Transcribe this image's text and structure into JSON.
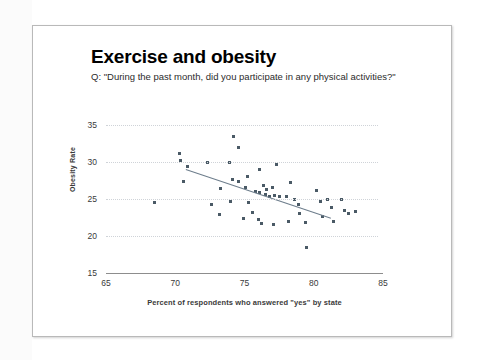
{
  "slide": {
    "title": "Exercise and obesity",
    "subtitle": "Q: \"During the past month, did you participate in any physical activities?\""
  },
  "chart_data": {
    "type": "scatter",
    "title": "Exercise and obesity",
    "subtitle": "Q: \"During the past month, did you participate in any physical activities?\"",
    "xlabel": "Percent of respondents who answered \"yes\" by state",
    "ylabel": "Obesity Rate",
    "xlim": [
      65,
      85
    ],
    "ylim": [
      15,
      35
    ],
    "xticks": [
      65,
      70,
      75,
      80,
      85
    ],
    "yticks": [
      15,
      20,
      25,
      30,
      35
    ],
    "grid": true,
    "legend": "none",
    "point_color": "#4a5a66",
    "trendline_color": "#6d7d8c",
    "series": [
      {
        "name": "States",
        "points": [
          [
            68.5,
            24.5
          ],
          [
            70.3,
            31.2
          ],
          [
            70.4,
            30.2
          ],
          [
            70.9,
            29.4
          ],
          [
            70.6,
            27.3
          ],
          [
            72.3,
            29.9
          ],
          [
            73.9,
            30.0
          ],
          [
            74.2,
            33.5
          ],
          [
            74.6,
            32.0
          ],
          [
            74.1,
            27.7
          ],
          [
            74.6,
            27.3
          ],
          [
            73.3,
            26.4
          ],
          [
            75.1,
            26.5
          ],
          [
            75.3,
            24.5
          ],
          [
            75.6,
            23.2
          ],
          [
            75.8,
            26.0
          ],
          [
            76.1,
            25.9
          ],
          [
            76.0,
            22.2
          ],
          [
            76.4,
            26.8
          ],
          [
            76.6,
            26.3
          ],
          [
            76.5,
            25.6
          ],
          [
            76.8,
            25.4
          ],
          [
            77.0,
            26.6
          ],
          [
            77.2,
            25.5
          ],
          [
            77.3,
            29.6
          ],
          [
            77.5,
            25.4
          ],
          [
            76.1,
            29.0
          ],
          [
            75.2,
            28.0
          ],
          [
            74.0,
            24.7
          ],
          [
            73.2,
            22.9
          ],
          [
            74.9,
            22.4
          ],
          [
            76.2,
            21.7
          ],
          [
            77.1,
            21.6
          ],
          [
            78.0,
            25.3
          ],
          [
            78.3,
            27.2
          ],
          [
            78.6,
            25.0
          ],
          [
            78.9,
            24.2
          ],
          [
            79.0,
            23.0
          ],
          [
            79.4,
            21.8
          ],
          [
            79.5,
            18.5
          ],
          [
            80.2,
            26.1
          ],
          [
            80.5,
            24.6
          ],
          [
            80.6,
            22.6
          ],
          [
            81.0,
            24.9
          ],
          [
            81.3,
            23.8
          ],
          [
            81.4,
            21.9
          ],
          [
            82.0,
            25.0
          ],
          [
            82.2,
            23.5
          ],
          [
            82.5,
            23.1
          ],
          [
            83.0,
            23.3
          ],
          [
            72.6,
            24.3
          ],
          [
            78.2,
            22.0
          ]
        ]
      }
    ],
    "trendline": {
      "x0": 70.8,
      "y0": 29.0,
      "x1": 81.3,
      "y1": 22.4
    }
  }
}
